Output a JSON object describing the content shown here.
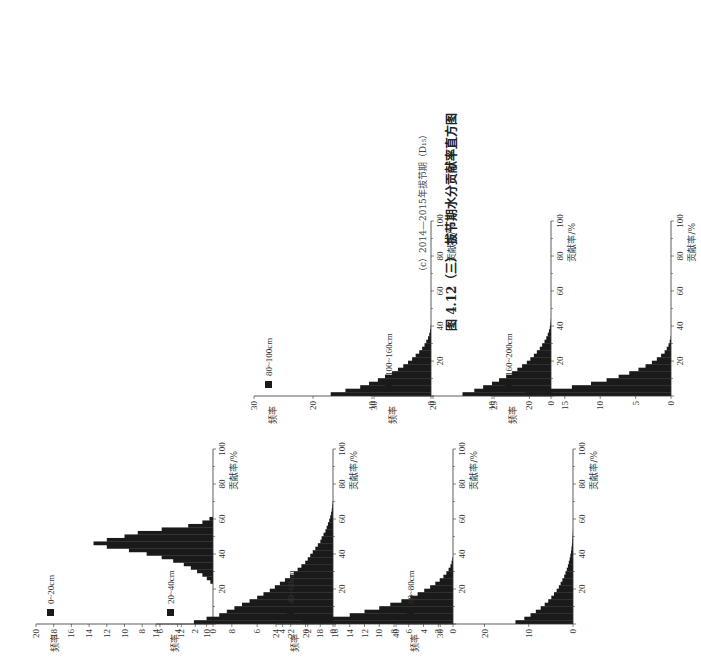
{
  "caption": {
    "sub": "（c）2014—2015年拔节期（D₁₅）",
    "main": "图 4.12（三） 拔节期水分贡献率直方图"
  },
  "chart_data": [
    {
      "type": "bar",
      "title": "0~20cm",
      "xlabel": "贡献率/%",
      "ylabel": "频率",
      "xlim": [
        0,
        100
      ],
      "ylim": [
        0,
        20
      ],
      "yticks": [
        0,
        2,
        4,
        6,
        8,
        10,
        12,
        14,
        16,
        18,
        20
      ],
      "xticks": [
        20,
        40,
        60,
        80,
        100
      ],
      "x": [
        24,
        26,
        28,
        30,
        32,
        34,
        36,
        38,
        40,
        42,
        44,
        46,
        48,
        50,
        52,
        54,
        56,
        58,
        60
      ],
      "values": [
        0.3,
        0.7,
        1.2,
        1.8,
        2.5,
        3.3,
        4.5,
        5.8,
        7.5,
        9.5,
        12,
        13.5,
        12,
        10,
        8.5,
        5.8,
        2.8,
        1.2,
        0.4
      ]
    },
    {
      "type": "bar",
      "title": "20~40cm",
      "xlabel": "贡献率/%",
      "ylabel": "频率",
      "xlim": [
        0,
        100
      ],
      "ylim": [
        0,
        14
      ],
      "yticks": [
        0,
        2,
        4,
        6,
        8,
        10,
        12,
        14
      ],
      "xticks": [
        20,
        40,
        60,
        80,
        100
      ],
      "x": [
        1,
        3,
        5,
        7,
        9,
        11,
        13,
        15,
        17,
        19,
        21,
        23,
        25,
        27,
        29,
        31,
        33,
        35,
        37,
        39,
        41,
        43,
        45,
        47,
        49,
        51,
        53,
        55,
        57,
        59,
        61,
        63,
        65,
        67,
        69
      ],
      "values": [
        11,
        10,
        9,
        8.4,
        7.8,
        7.2,
        6.6,
        6.0,
        5.5,
        5.0,
        4.6,
        4.2,
        3.8,
        3.4,
        3.1,
        2.8,
        2.5,
        2.2,
        2.0,
        1.8,
        1.6,
        1.4,
        1.2,
        1.0,
        0.9,
        0.75,
        0.6,
        0.5,
        0.4,
        0.3,
        0.22,
        0.15,
        0.1,
        0.06,
        0.03
      ]
    },
    {
      "type": "bar",
      "title": "40~60cm",
      "xlabel": "贡献率/%",
      "ylabel": "频率",
      "xlim": [
        0,
        100
      ],
      "ylim": [
        0,
        24
      ],
      "yticks": [
        0,
        2,
        4,
        6,
        8,
        10,
        12,
        14,
        16,
        18,
        20,
        22,
        24
      ],
      "xticks": [
        20,
        40,
        60,
        80,
        100
      ],
      "x": [
        1,
        3,
        5,
        7,
        9,
        11,
        13,
        15,
        17,
        19,
        21,
        23,
        25,
        27,
        29,
        31,
        33,
        35,
        37
      ],
      "values": [
        20.5,
        17,
        14,
        12,
        10,
        8.5,
        7,
        5.8,
        4.8,
        3.9,
        3.1,
        2.4,
        1.8,
        1.3,
        0.9,
        0.6,
        0.35,
        0.2,
        0.08
      ]
    },
    {
      "type": "bar",
      "title": "60~80cm",
      "xlabel": "贡献率/%",
      "ylabel": "频率",
      "xlim": [
        0,
        100
      ],
      "ylim": [
        0,
        40
      ],
      "yticks": [
        0,
        10,
        20,
        30,
        40
      ],
      "xticks": [
        20,
        40,
        60,
        80,
        100
      ],
      "x": [
        1,
        3,
        5,
        7,
        9,
        11,
        13,
        15,
        17,
        19,
        21,
        23,
        25,
        27,
        29,
        31,
        33,
        35,
        37,
        39,
        41,
        43,
        45,
        47,
        49,
        51,
        53
      ],
      "values": [
        13,
        11,
        9.6,
        8.4,
        7.3,
        6.4,
        5.6,
        4.9,
        4.3,
        3.7,
        3.2,
        2.8,
        2.4,
        2.0,
        1.7,
        1.4,
        1.15,
        0.95,
        0.75,
        0.6,
        0.45,
        0.35,
        0.25,
        0.18,
        0.12,
        0.07,
        0.03
      ]
    },
    {
      "type": "bar",
      "title": "80~100cm",
      "xlabel": "贡献率/%",
      "ylabel": "频率",
      "xlim": [
        0,
        100
      ],
      "ylim": [
        0,
        30
      ],
      "yticks": [
        0,
        10,
        20,
        30
      ],
      "xticks": [
        20,
        40,
        60,
        80,
        100
      ],
      "x": [
        1,
        3,
        5,
        7,
        9,
        11,
        13,
        15,
        17,
        19,
        21,
        23,
        25,
        27,
        29,
        31,
        33,
        35,
        37,
        39
      ],
      "values": [
        17,
        14.5,
        12,
        10.5,
        9,
        7.8,
        6.6,
        5.6,
        4.7,
        3.9,
        3.2,
        2.6,
        2.0,
        1.5,
        1.1,
        0.8,
        0.5,
        0.3,
        0.15,
        0.06
      ]
    },
    {
      "type": "bar",
      "title": "100~160cm",
      "xlabel": "贡献率/%",
      "ylabel": "频率",
      "xlim": [
        0,
        100
      ],
      "ylim": [
        0,
        30
      ],
      "yticks": [
        0,
        10,
        20,
        30
      ],
      "xticks": [
        20,
        40,
        60,
        80,
        100
      ],
      "x": [
        1,
        3,
        5,
        7,
        9,
        11,
        13,
        15,
        17,
        19,
        21,
        23,
        25,
        27,
        29,
        31,
        33,
        35,
        37,
        39,
        41,
        43
      ],
      "values": [
        15,
        13,
        11.5,
        10,
        8.8,
        7.6,
        6.6,
        5.7,
        4.9,
        4.1,
        3.5,
        2.9,
        2.4,
        1.9,
        1.5,
        1.1,
        0.8,
        0.55,
        0.35,
        0.2,
        0.1,
        0.04
      ]
    },
    {
      "type": "bar",
      "title": "160~200cm",
      "xlabel": "贡献率/%",
      "ylabel": "频率",
      "xlim": [
        0,
        100
      ],
      "ylim": [
        0,
        25
      ],
      "yticks": [
        0,
        5,
        10,
        15,
        20,
        25
      ],
      "xticks": [
        20,
        40,
        60,
        80,
        100
      ],
      "x": [
        1,
        3,
        5,
        7,
        9,
        11,
        13,
        15,
        17,
        19,
        21,
        23,
        25,
        27,
        29,
        31,
        33
      ],
      "values": [
        20.5,
        17.3,
        14,
        11.3,
        9.1,
        7.4,
        5.9,
        4.6,
        3.6,
        2.7,
        2.0,
        1.4,
        0.9,
        0.6,
        0.35,
        0.18,
        0.06
      ]
    }
  ]
}
